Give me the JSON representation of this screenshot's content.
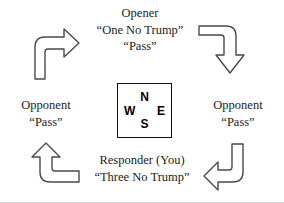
{
  "diagram": {
    "type": "cycle-diagram",
    "stroke_color": "#4a4a4a",
    "text_color": "#222222",
    "background": "#ffffff"
  },
  "positions": {
    "opener": {
      "role": "Opener",
      "bid": "“One No Trump”",
      "second_call": "“Pass”"
    },
    "opponent_right": {
      "role": "Opponent",
      "call": "“Pass”"
    },
    "responder": {
      "role": "Responder (You)",
      "bid": "“Three No Trump”"
    },
    "opponent_left": {
      "role": "Opponent",
      "call": "“Pass”"
    }
  },
  "compass": {
    "north": "N",
    "east": "E",
    "south": "S",
    "west": "W"
  },
  "arrows": [
    {
      "id": "top-right",
      "icon": "elbow-arrow-right-down",
      "from": "opener",
      "to": "opponent_right"
    },
    {
      "id": "bottom-right",
      "icon": "elbow-arrow-down-left",
      "from": "opponent_right",
      "to": "responder"
    },
    {
      "id": "bottom-left",
      "icon": "elbow-arrow-left-up",
      "from": "responder",
      "to": "opponent_left"
    },
    {
      "id": "top-left",
      "icon": "elbow-arrow-up-right",
      "from": "opponent_left",
      "to": "opener"
    }
  ]
}
